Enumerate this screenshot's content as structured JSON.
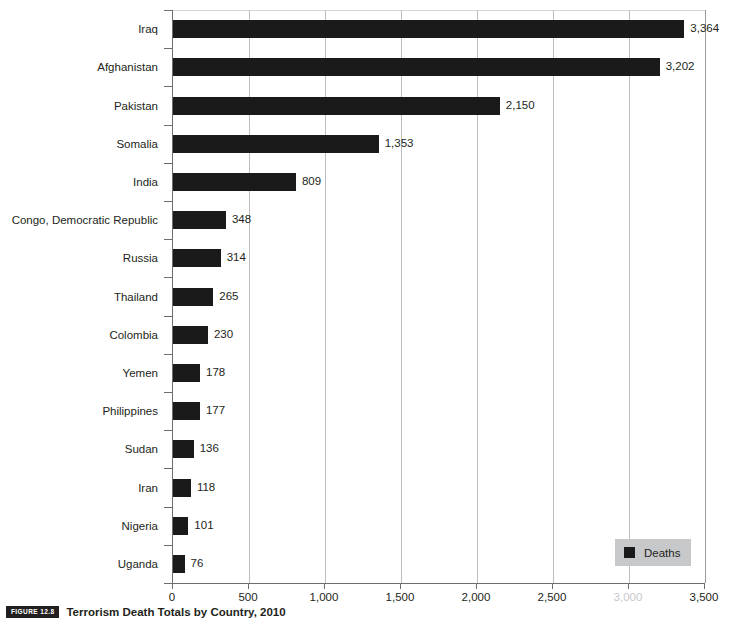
{
  "chart_data": {
    "type": "bar",
    "orientation": "horizontal",
    "title": "Terrorism Death Totals by Country, 2010",
    "xlabel": "",
    "ylabel": "",
    "xlim": [
      0,
      3500
    ],
    "xticks": [
      0,
      500,
      1000,
      1500,
      2000,
      2500,
      3000,
      3500
    ],
    "xticklabels": [
      "0",
      "500",
      "1,000",
      "1,500",
      "2,000",
      "2,500",
      "3,000",
      "3,500"
    ],
    "grid": true,
    "legend": {
      "position": "bottom-right",
      "entries": [
        "Deaths"
      ]
    },
    "categories": [
      "Iraq",
      "Afghanistan",
      "Pakistan",
      "Somalia",
      "India",
      "Congo, Democratic Republic",
      "Russia",
      "Thailand",
      "Colombia",
      "Yemen",
      "Philippines",
      "Sudan",
      "Iran",
      "Nigeria",
      "Uganda"
    ],
    "values": [
      3364,
      3202,
      2150,
      1353,
      809,
      348,
      314,
      265,
      230,
      178,
      177,
      136,
      118,
      101,
      76
    ],
    "value_labels": [
      "3,364",
      "3,202",
      "2,150",
      "1,353",
      "809",
      "348",
      "314",
      "265",
      "230",
      "178",
      "177",
      "136",
      "118",
      "101",
      "76"
    ],
    "series": [
      {
        "name": "Deaths",
        "color": "#1a1a1a",
        "values": [
          3364,
          3202,
          2150,
          1353,
          809,
          348,
          314,
          265,
          230,
          178,
          177,
          136,
          118,
          101,
          76
        ]
      }
    ]
  },
  "legend": {
    "label": "Deaths",
    "swatch_color": "#1a1a1a",
    "background_color": "#c7c8ca"
  },
  "caption": {
    "badge": "FIGURE 12.8",
    "text": "Terrorism Death Totals by Country, 2010"
  },
  "colors": {
    "bar": "#1a1a1a",
    "gridline": "#bcbec0",
    "axis": "#6d6e71",
    "text": "#231f20",
    "background": "#ffffff"
  }
}
